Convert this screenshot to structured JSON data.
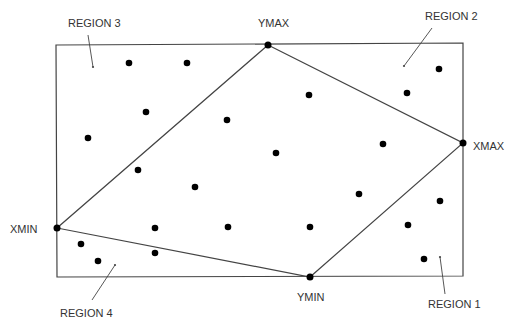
{
  "colors": {
    "background": "#ffffff",
    "line": "#444444",
    "dot": "#000000",
    "text": "#333333"
  },
  "boundary": {
    "points": "56,45 463,43 463,276 57,277"
  },
  "hull": {
    "points": "268,45 463,143 310,277 57,228"
  },
  "extremes": [
    {
      "id": "ymax",
      "label": "YMAX",
      "x": 268,
      "y": 45,
      "lx": 258,
      "ly": 27
    },
    {
      "id": "xmax",
      "label": "XMAX",
      "x": 463,
      "y": 143,
      "lx": 473,
      "ly": 150
    },
    {
      "id": "ymin",
      "label": "YMIN",
      "x": 310,
      "y": 277,
      "lx": 297,
      "ly": 301
    },
    {
      "id": "xmin",
      "label": "XMIN",
      "x": 57,
      "y": 228,
      "lx": 10,
      "ly": 233
    }
  ],
  "regions": [
    {
      "id": "region-3",
      "label": "REGION 3",
      "lx": 68,
      "ly": 27,
      "ax1": 88,
      "ay1": 35,
      "ax2": 93,
      "ay2": 67
    },
    {
      "id": "region-2",
      "label": "REGION 2",
      "lx": 425,
      "ly": 20,
      "ax1": 432,
      "ay1": 28,
      "ax2": 404,
      "ay2": 66
    },
    {
      "id": "region-4",
      "label": "REGION 4",
      "lx": 60,
      "ly": 317,
      "ax1": 92,
      "ay1": 300,
      "ax2": 115,
      "ay2": 265
    },
    {
      "id": "region-1",
      "label": "REGION 1",
      "lx": 428,
      "ly": 308,
      "ax1": 445,
      "ay1": 294,
      "ax2": 440,
      "ay2": 257
    }
  ],
  "dots": [
    {
      "x": 129,
      "y": 63
    },
    {
      "x": 187,
      "y": 63
    },
    {
      "x": 146,
      "y": 112
    },
    {
      "x": 88,
      "y": 138
    },
    {
      "x": 227,
      "y": 120
    },
    {
      "x": 309,
      "y": 95
    },
    {
      "x": 407,
      "y": 93
    },
    {
      "x": 439,
      "y": 69
    },
    {
      "x": 276,
      "y": 153
    },
    {
      "x": 383,
      "y": 144
    },
    {
      "x": 138,
      "y": 170
    },
    {
      "x": 195,
      "y": 187
    },
    {
      "x": 359,
      "y": 194
    },
    {
      "x": 440,
      "y": 201
    },
    {
      "x": 155,
      "y": 228
    },
    {
      "x": 228,
      "y": 227
    },
    {
      "x": 310,
      "y": 227
    },
    {
      "x": 408,
      "y": 225
    },
    {
      "x": 424,
      "y": 259
    },
    {
      "x": 81,
      "y": 244
    },
    {
      "x": 98,
      "y": 261
    },
    {
      "x": 155,
      "y": 253
    }
  ]
}
